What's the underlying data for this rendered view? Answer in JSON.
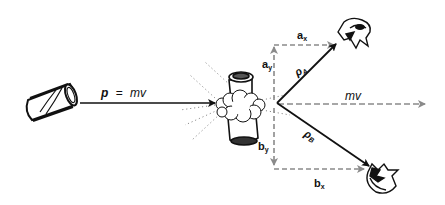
{
  "diagram": {
    "colors": {
      "line": "#111111",
      "dashed": "#8a8a8a",
      "background": "#ffffff"
    },
    "incoming": {
      "object": "can",
      "label_p": "p",
      "label_eq": "=",
      "label_mv": "mv"
    },
    "collision": {
      "object": "colliding-can-with-debris-cloud"
    },
    "resultant": {
      "label": "mv"
    },
    "fragment_a": {
      "momentum_label": "ρ",
      "momentum_sub": "A",
      "x_component_label": "a",
      "x_component_sub": "x",
      "y_component_label": "a",
      "y_component_sub": "y"
    },
    "fragment_b": {
      "momentum_label": "ρ",
      "momentum_sub": "B",
      "x_component_label": "b",
      "x_component_sub": "x",
      "y_component_label": "b",
      "y_component_sub": "y"
    }
  }
}
